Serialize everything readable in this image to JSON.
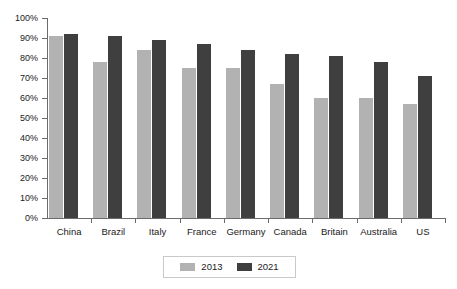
{
  "chart_data": {
    "type": "bar",
    "title": "",
    "subtitle": "",
    "xlabel": "",
    "ylabel": "",
    "ylim": [
      0,
      100
    ],
    "y_tick_labels": [
      "100%",
      "90%",
      "80%",
      "70%",
      "60%",
      "50%",
      "40%",
      "30%",
      "20%",
      "10%",
      "0%"
    ],
    "y_tick_values": [
      100,
      90,
      80,
      70,
      60,
      50,
      40,
      30,
      20,
      10,
      0
    ],
    "grid": false,
    "legend_position": "bottom-center",
    "categories": [
      "China",
      "Brazil",
      "Italy",
      "France",
      "Germany",
      "Canada",
      "Britain",
      "Australia",
      "US"
    ],
    "series": [
      {
        "name": "2013",
        "color": "#b2b2b2",
        "values": [
          91,
          78,
          84,
          75,
          75,
          67,
          60,
          60,
          57
        ]
      },
      {
        "name": "2021",
        "color": "#3f3f3f",
        "values": [
          92,
          91,
          89,
          87,
          84,
          82,
          81,
          78,
          71
        ]
      }
    ]
  },
  "axes": {
    "axis_color": "#6b6b6b"
  }
}
